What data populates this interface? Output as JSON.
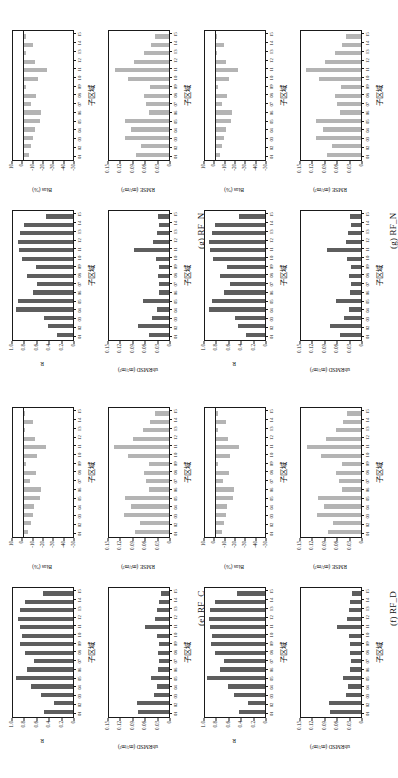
{
  "figure": {
    "subregion_axis_label": "子区域",
    "categories": [
      "01",
      "02",
      "03",
      "04",
      "05",
      "06",
      "07",
      "08",
      "09",
      "10",
      "11",
      "12",
      "13",
      "14",
      "15"
    ],
    "metrics": {
      "r": {
        "label": "R",
        "ticks": [
          "1.0",
          "0.8",
          "0.6",
          "0.4",
          "0.2",
          "0"
        ],
        "min": 0,
        "max": 1.0
      },
      "bias": {
        "label": "Bias (%)",
        "ticks": [
          "10",
          "0",
          "-10",
          "-20",
          "-30",
          "-40",
          "-50"
        ],
        "min": -50,
        "max": 10
      },
      "rmse": {
        "label": "RMSE (m³/m³)",
        "ticks": [
          "0.15",
          "0.12",
          "0.09",
          "0.06",
          "0.03",
          "0"
        ],
        "min": 0,
        "max": 0.15
      },
      "ubrmsd": {
        "label": "ubRMSD (m³/m³)",
        "ticks": [
          "0.15",
          "0.12",
          "0.09",
          "0.06",
          "0.03",
          "0"
        ],
        "min": 0,
        "max": 0.15
      }
    },
    "colors": {
      "dark_bar": "#5e5e5e",
      "light_bar": "#b4b4b4",
      "axis": "#1a1a1a"
    },
    "groups": [
      {
        "id": "rf_c",
        "caption": "(e) RF_C",
        "charts": {
          "r": [
            0.47,
            0.3,
            0.52,
            0.68,
            0.92,
            0.74,
            0.63,
            0.77,
            0.85,
            0.83,
            0.86,
            0.88,
            0.86,
            0.78,
            0.48
          ],
          "bias": [
            -5.0,
            -7.5,
            -9.0,
            -10.5,
            -16.0,
            -17.0,
            -6.5,
            -12.0,
            -2.5,
            -13.5,
            -22.0,
            -11.0,
            -2.0,
            -9.0,
            -2.0
          ],
          "rmse": [
            0.082,
            0.069,
            0.108,
            0.092,
            0.107,
            0.049,
            0.056,
            0.061,
            0.048,
            0.1,
            0.132,
            0.086,
            0.062,
            0.045,
            0.035
          ],
          "ubrmsd": [
            0.074,
            0.078,
            0.036,
            0.03,
            0.044,
            0.026,
            0.025,
            0.026,
            0.025,
            0.028,
            0.058,
            0.035,
            0.029,
            0.025,
            0.02
          ]
        }
      },
      {
        "id": "rf_d",
        "caption": "(f) RF_D",
        "charts": {
          "r": [
            0.42,
            0.28,
            0.5,
            0.6,
            0.94,
            0.72,
            0.66,
            0.81,
            0.87,
            0.86,
            0.88,
            0.9,
            0.88,
            0.8,
            0.45
          ],
          "bias": [
            -6.0,
            -8.0,
            -10.0,
            -11.5,
            -17.0,
            -18.0,
            -7.5,
            -13.0,
            -3.0,
            -14.5,
            -23.0,
            -12.0,
            -2.5,
            -10.0,
            -2.5
          ],
          "rmse": [
            0.08,
            0.067,
            0.106,
            0.09,
            0.105,
            0.047,
            0.054,
            0.06,
            0.046,
            0.098,
            0.13,
            0.084,
            0.06,
            0.043,
            0.033
          ],
          "ubrmsd": [
            0.074,
            0.078,
            0.036,
            0.031,
            0.044,
            0.026,
            0.025,
            0.026,
            0.026,
            0.029,
            0.059,
            0.035,
            0.029,
            0.026,
            0.021
          ]
        }
      },
      {
        "id": "rf_n_top",
        "caption": "(g) RF_N",
        "charts": {
          "r": [
            0.26,
            0.41,
            0.46,
            0.92,
            0.88,
            0.64,
            0.58,
            0.75,
            0.6,
            0.82,
            0.87,
            0.89,
            0.85,
            0.79,
            0.44
          ],
          "bias": [
            -5.5,
            -7.0,
            -9.5,
            -11.0,
            -16.5,
            -17.5,
            -7.0,
            -12.5,
            -2.8,
            -14.0,
            -22.5,
            -11.5,
            -2.2,
            -9.5,
            -2.2
          ],
          "rmse": [
            0.081,
            0.068,
            0.107,
            0.091,
            0.106,
            0.048,
            0.055,
            0.06,
            0.047,
            0.099,
            0.131,
            0.085,
            0.061,
            0.044,
            0.034
          ],
          "ubrmsd": [
            0.048,
            0.076,
            0.04,
            0.028,
            0.062,
            0.025,
            0.024,
            0.027,
            0.024,
            0.032,
            0.084,
            0.038,
            0.03,
            0.024,
            0.026
          ]
        }
      },
      {
        "id": "rf_n_bottom",
        "caption": "(g) RF_N",
        "charts": {
          "r": [
            0.3,
            0.44,
            0.48,
            0.9,
            0.86,
            0.66,
            0.56,
            0.73,
            0.62,
            0.84,
            0.88,
            0.9,
            0.86,
            0.8,
            0.42
          ],
          "bias": [
            -4.5,
            -6.5,
            -8.5,
            -10.0,
            -15.5,
            -16.5,
            -6.0,
            -11.5,
            -2.4,
            -13.0,
            -21.5,
            -10.5,
            -1.8,
            -8.5,
            -1.8
          ],
          "rmse": [
            0.083,
            0.07,
            0.109,
            0.093,
            0.108,
            0.05,
            0.057,
            0.062,
            0.049,
            0.101,
            0.133,
            0.087,
            0.063,
            0.046,
            0.036
          ],
          "ubrmsd": [
            0.05,
            0.074,
            0.042,
            0.029,
            0.06,
            0.026,
            0.025,
            0.028,
            0.025,
            0.033,
            0.082,
            0.037,
            0.031,
            0.025,
            0.027
          ]
        }
      }
    ]
  }
}
